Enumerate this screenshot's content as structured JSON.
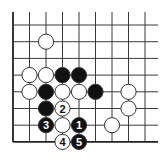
{
  "diagram": {
    "type": "go-board-fragment",
    "grid": {
      "columns": 9,
      "rows": 8,
      "x0": 13,
      "y0": 25,
      "dx": 16.5,
      "dy": 16.7,
      "top_extension": 13,
      "right_extension": 13,
      "edges": [
        "left",
        "bottom"
      ]
    },
    "colors": {
      "line": "#3a3a3a",
      "edge": "#222222",
      "black_stone": "#111111",
      "white_stone": "#ffffff",
      "stone_outline": "#333333"
    },
    "stone_radius": 7.6,
    "stones": [
      {
        "color": "white",
        "col": 2,
        "row": 1,
        "label": ""
      },
      {
        "color": "white",
        "col": 1,
        "row": 3,
        "label": ""
      },
      {
        "color": "white",
        "col": 2,
        "row": 3,
        "label": ""
      },
      {
        "color": "black",
        "col": 3,
        "row": 3,
        "label": ""
      },
      {
        "color": "black",
        "col": 4,
        "row": 3,
        "label": ""
      },
      {
        "color": "white",
        "col": 1,
        "row": 4,
        "label": ""
      },
      {
        "color": "black",
        "col": 2,
        "row": 4,
        "label": ""
      },
      {
        "color": "white",
        "col": 3,
        "row": 4,
        "label": ""
      },
      {
        "color": "white",
        "col": 4,
        "row": 4,
        "label": ""
      },
      {
        "color": "black",
        "col": 5,
        "row": 4,
        "label": ""
      },
      {
        "color": "white",
        "col": 7,
        "row": 4,
        "label": ""
      },
      {
        "color": "black",
        "col": 2,
        "row": 5,
        "label": ""
      },
      {
        "color": "white",
        "col": 3,
        "row": 5,
        "label": "2"
      },
      {
        "color": "white",
        "col": 7,
        "row": 5,
        "label": ""
      },
      {
        "color": "black",
        "col": 2,
        "row": 6,
        "label": "3"
      },
      {
        "color": "white",
        "col": 3,
        "row": 6,
        "label": ""
      },
      {
        "color": "black",
        "col": 4,
        "row": 6,
        "label": "1"
      },
      {
        "color": "white",
        "col": 6,
        "row": 6,
        "label": ""
      },
      {
        "color": "white",
        "col": 3,
        "row": 7,
        "label": "4"
      },
      {
        "color": "black",
        "col": 4,
        "row": 7,
        "label": "5"
      }
    ]
  }
}
